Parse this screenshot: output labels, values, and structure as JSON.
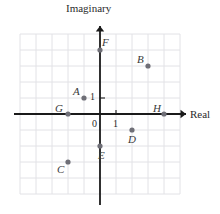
{
  "chart_data": {
    "type": "scatter",
    "title": "",
    "xlabel": "Real",
    "ylabel": "Imaginary",
    "xlim": [
      -5,
      5
    ],
    "ylim": [
      -5,
      5
    ],
    "grid": true,
    "legend": "none",
    "x_tick_labels": [
      "0",
      "1"
    ],
    "y_tick_labels": [
      "1"
    ],
    "unit_px": 16,
    "points": [
      {
        "label": "A",
        "x": -1,
        "y": 1,
        "label_dx": -11,
        "label_dy": -12
      },
      {
        "label": "B",
        "x": 3,
        "y": 3,
        "label_dx": -11,
        "label_dy": -12
      },
      {
        "label": "C",
        "x": -2,
        "y": -3,
        "label_dx": -11,
        "label_dy": 2
      },
      {
        "label": "D",
        "x": 2,
        "y": -1,
        "label_dx": -4,
        "label_dy": 4
      },
      {
        "label": "E",
        "x": 0,
        "y": -2,
        "label_dx": -2,
        "label_dy": 4
      },
      {
        "label": "F",
        "x": 0,
        "y": 4,
        "label_dx": 2,
        "label_dy": -13
      },
      {
        "label": "G",
        "x": -2,
        "y": 0,
        "label_dx": -13,
        "label_dy": -11
      },
      {
        "label": "H",
        "x": 4,
        "y": 0,
        "label_dx": -11,
        "label_dy": -11
      }
    ]
  },
  "axes": {
    "imaginary_label": "Imaginary",
    "real_label": "Real",
    "origin_label": "0",
    "real_unit_label": "1",
    "imaginary_unit_label": "1"
  },
  "colors": {
    "grid": "#e2e2e6",
    "axis": "#1a1a1a",
    "point": "#6f6f77",
    "text": "#2b2b2b",
    "label": "#3a3a3a",
    "background": "#ffffff"
  }
}
